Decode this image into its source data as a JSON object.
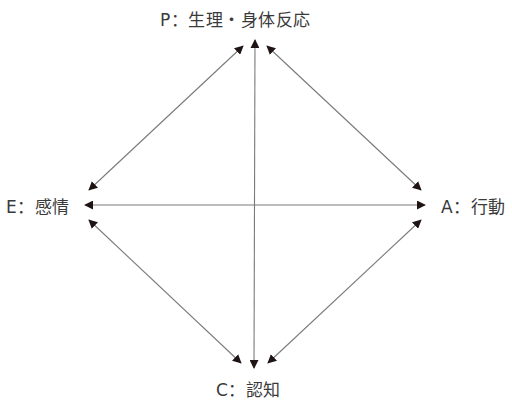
{
  "diagram": {
    "nodes": [
      {
        "id": "P",
        "label": "P：生理・身体反応",
        "position": "top"
      },
      {
        "id": "E",
        "label": "E：感情",
        "position": "left"
      },
      {
        "id": "A",
        "label": "A：行動",
        "position": "right"
      },
      {
        "id": "C",
        "label": "C：認知",
        "position": "bottom"
      }
    ],
    "edges": [
      {
        "from": "P",
        "to": "E",
        "type": "bidirectional"
      },
      {
        "from": "P",
        "to": "A",
        "type": "bidirectional"
      },
      {
        "from": "P",
        "to": "C",
        "type": "bidirectional"
      },
      {
        "from": "E",
        "to": "A",
        "type": "bidirectional"
      },
      {
        "from": "E",
        "to": "C",
        "type": "bidirectional"
      },
      {
        "from": "A",
        "to": "C",
        "type": "bidirectional"
      }
    ],
    "colors": {
      "line": "#7a7a7a",
      "arrowhead": "#1e1414",
      "text": "#3a3a3a"
    }
  }
}
